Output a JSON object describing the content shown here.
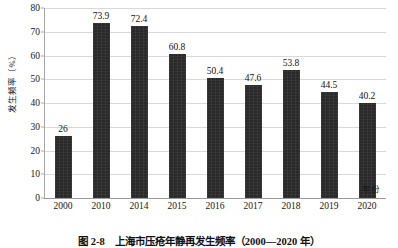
{
  "chart_data": {
    "type": "bar",
    "title": "",
    "caption": "图 2-8　上海市压疮年静再发生频率（2000—2020 年）",
    "xlabel": "年份",
    "ylabel": "发生频率（%）",
    "categories": [
      "2000",
      "2010",
      "2014",
      "2015",
      "2016",
      "2017",
      "2018",
      "2019",
      "2020"
    ],
    "values": [
      26,
      73.9,
      72.4,
      60.8,
      50.4,
      47.6,
      53.8,
      44.5,
      40.2
    ],
    "value_labels": [
      "26",
      "73.9",
      "72.4",
      "60.8",
      "50.4",
      "47.6",
      "53.8",
      "44.5",
      "40.2"
    ],
    "ylim": [
      0,
      80
    ],
    "yticks": [
      0,
      10,
      20,
      30,
      40,
      50,
      60,
      70,
      80
    ],
    "ytick_labels": [
      "0",
      "10",
      "20",
      "30",
      "40",
      "50",
      "60",
      "70",
      "80"
    ],
    "grid": true,
    "legend": false,
    "bar_color": "#2a2a2a",
    "grid_color": "#d9d9d9",
    "axis_color": "#a8a8a8"
  }
}
